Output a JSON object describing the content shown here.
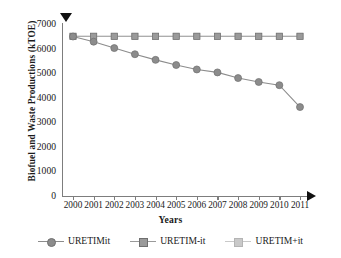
{
  "chart_data": {
    "type": "line",
    "title": "",
    "xlabel": "Years",
    "ylabel": "Biofuel and Waste Productions (kTOE)",
    "categories": [
      "2000",
      "2001",
      "2002",
      "2003",
      "2004",
      "2005",
      "2006",
      "2007",
      "2008",
      "2009",
      "2010",
      "2011"
    ],
    "ylim": [
      0,
      7000
    ],
    "yticks": [
      0,
      1000,
      2000,
      3000,
      4000,
      5000,
      6000,
      7000
    ],
    "ytick_labels": [
      "0",
      "1000",
      "2000",
      "3000",
      "4000",
      "5000",
      "6000",
      "7000"
    ],
    "grid": false,
    "legend_position": "bottom",
    "series": [
      {
        "name": "URETIMit",
        "marker": "circle",
        "color": "#8c8c8c",
        "values": [
          6490,
          6280,
          6020,
          5770,
          5540,
          5330,
          5150,
          5030,
          4800,
          4640,
          4510,
          3620
        ]
      },
      {
        "name": "URETIM-it",
        "marker": "square",
        "color": "#9a9a9a",
        "values": [
          6500,
          6500,
          6500,
          6500,
          6500,
          6500,
          6500,
          6500,
          6500,
          6500,
          6500,
          6500
        ]
      },
      {
        "name": "URETIM+it",
        "marker": "square",
        "color": "#c9c9c9",
        "values": [
          6500,
          6500,
          6500,
          6500,
          6500,
          6500,
          6500,
          6500,
          6500,
          6500,
          6500,
          6500
        ]
      }
    ],
    "annotations": {
      "y_axis_arrow": "down-triangle-marker",
      "x_axis_arrow": "right-arrow-marker"
    }
  },
  "colors": {
    "axis": "#7d7d7d",
    "arrow": "#111111",
    "text": "#1a1a1a"
  }
}
